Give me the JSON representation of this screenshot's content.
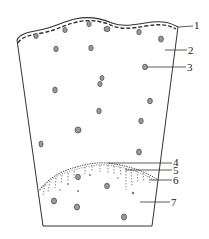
{
  "diagram": {
    "labels": [
      {
        "id": "1",
        "text": "1",
        "x": 193,
        "y": 20
      },
      {
        "id": "2",
        "text": "2",
        "x": 187,
        "y": 45
      },
      {
        "id": "3",
        "text": "3",
        "x": 186,
        "y": 62
      },
      {
        "id": "4",
        "text": "4",
        "x": 172,
        "y": 157
      },
      {
        "id": "5",
        "text": "5",
        "x": 172,
        "y": 166
      },
      {
        "id": "6",
        "text": "6",
        "x": 172,
        "y": 175
      },
      {
        "id": "7",
        "text": "7",
        "x": 170,
        "y": 197
      }
    ],
    "colors": {
      "stroke": "#333333",
      "cell_fill": "#888888",
      "background": "#ffffff"
    }
  }
}
